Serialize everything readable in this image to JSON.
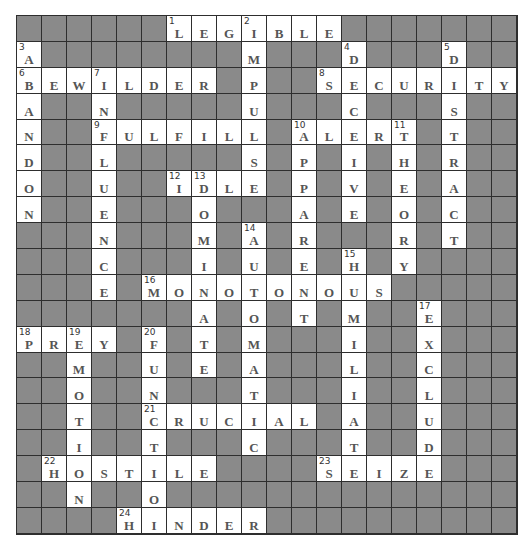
{
  "puzzle": {
    "rows": 20,
    "cols": 20,
    "colors": {
      "block": "#8a8a8a",
      "open": "#ffffff",
      "line": "#2e2e2e",
      "letter": "#555555",
      "number": "#333333"
    },
    "grid": [
      "######LEGIBLE#######",
      "A########M###D###D##",
      "BEWILDER#P##SECURITY",
      "A##N#####U###C###S##",
      "N##FULFILL#ALERT#T##",
      "D##L#####S#P#I#H#R##",
      "O##U##IDLE#P#V#E#A##",
      "N##E###O###A#E#O#C##",
      "###N###M#A#R###R#T##",
      "###C###I#U#E#H#Y####",
      "###E#MONOTONOUS#####",
      "#######A#O#T#M##E###",
      "PREY#F#T#M###I##X###",
      "##M##U#E#A###L##C###",
      "##O##N###T###I##L###",
      "##T##CRUCIAL#A##U###",
      "##I##T###C###T##D###",
      "#HOSTILE####SEIZE###",
      "##N##O##############",
      "####HINDER##########"
    ],
    "numbers": [
      {
        "n": 1,
        "r": 0,
        "c": 6
      },
      {
        "n": 2,
        "r": 0,
        "c": 9
      },
      {
        "n": 3,
        "r": 1,
        "c": 0
      },
      {
        "n": 4,
        "r": 1,
        "c": 13
      },
      {
        "n": 5,
        "r": 1,
        "c": 17
      },
      {
        "n": 6,
        "r": 2,
        "c": 0
      },
      {
        "n": 7,
        "r": 2,
        "c": 3
      },
      {
        "n": 8,
        "r": 2,
        "c": 12
      },
      {
        "n": 9,
        "r": 4,
        "c": 3
      },
      {
        "n": 10,
        "r": 4,
        "c": 11
      },
      {
        "n": 11,
        "r": 4,
        "c": 15
      },
      {
        "n": 12,
        "r": 6,
        "c": 6
      },
      {
        "n": 13,
        "r": 6,
        "c": 7
      },
      {
        "n": 14,
        "r": 8,
        "c": 9
      },
      {
        "n": 15,
        "r": 9,
        "c": 13
      },
      {
        "n": 16,
        "r": 10,
        "c": 5
      },
      {
        "n": 17,
        "r": 11,
        "c": 16
      },
      {
        "n": 18,
        "r": 12,
        "c": 0
      },
      {
        "n": 19,
        "r": 12,
        "c": 2
      },
      {
        "n": 20,
        "r": 12,
        "c": 5
      },
      {
        "n": 21,
        "r": 15,
        "c": 5
      },
      {
        "n": 22,
        "r": 17,
        "c": 1
      },
      {
        "n": 23,
        "r": 17,
        "c": 12
      },
      {
        "n": 24,
        "r": 19,
        "c": 4
      }
    ],
    "across": [
      {
        "n": 1,
        "answer": "LEGIBLE"
      },
      {
        "n": 6,
        "answer": "BEWILDER"
      },
      {
        "n": 8,
        "answer": "SECURITY"
      },
      {
        "n": 9,
        "answer": "FULFILL"
      },
      {
        "n": 10,
        "answer": "ALERT"
      },
      {
        "n": 12,
        "answer": "IDLE"
      },
      {
        "n": 16,
        "answer": "MONOTONOUS"
      },
      {
        "n": 18,
        "answer": "PREY"
      },
      {
        "n": 21,
        "answer": "CRUCIAL"
      },
      {
        "n": 22,
        "answer": "HOSTILE"
      },
      {
        "n": 23,
        "answer": "SEIZE"
      },
      {
        "n": 24,
        "answer": "HINDER"
      }
    ],
    "down": [
      {
        "n": 2,
        "answer": "IMPULSE"
      },
      {
        "n": 3,
        "answer": "ABANDON"
      },
      {
        "n": 4,
        "answer": "DECEIVE"
      },
      {
        "n": 5,
        "answer": "DISTRACT"
      },
      {
        "n": 7,
        "answer": "INFLUENCE"
      },
      {
        "n": 10,
        "answer": "APPARENT"
      },
      {
        "n": 11,
        "answer": "THEORY"
      },
      {
        "n": 13,
        "answer": "DOMINATE"
      },
      {
        "n": 14,
        "answer": "AUTOMATIC"
      },
      {
        "n": 15,
        "answer": "HUMILIATE"
      },
      {
        "n": 17,
        "answer": "EXCLUDE"
      },
      {
        "n": 19,
        "answer": "EMOTION"
      },
      {
        "n": 20,
        "answer": "FUNCTION"
      }
    ]
  }
}
